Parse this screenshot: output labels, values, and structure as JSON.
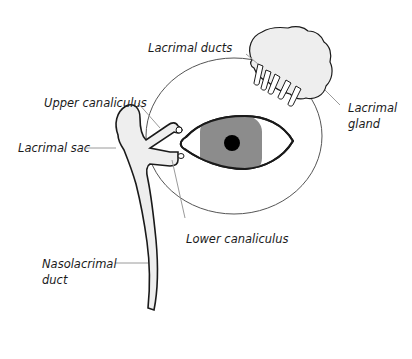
{
  "diagram": {
    "labels": {
      "lacrimal_ducts": "Lacrimal ducts",
      "lacrimal_gland_line1": "Lacrimal",
      "lacrimal_gland_line2": "gland",
      "upper_canaliculus": "Upper canaliculus",
      "lacrimal_sac": "Lacrimal sac",
      "lower_canaliculus": "Lower canaliculus",
      "nasolacrimal_duct_line1": "Nasolacrimal",
      "nasolacrimal_duct_line2": "duct"
    },
    "colors": {
      "outline": "#1a1a1a",
      "leader_line": "#9a9a9a",
      "fill_light": "#eeeeee",
      "iris": "#8c8c8c",
      "pupil": "#000000",
      "orbit_outline": "#555555"
    }
  }
}
